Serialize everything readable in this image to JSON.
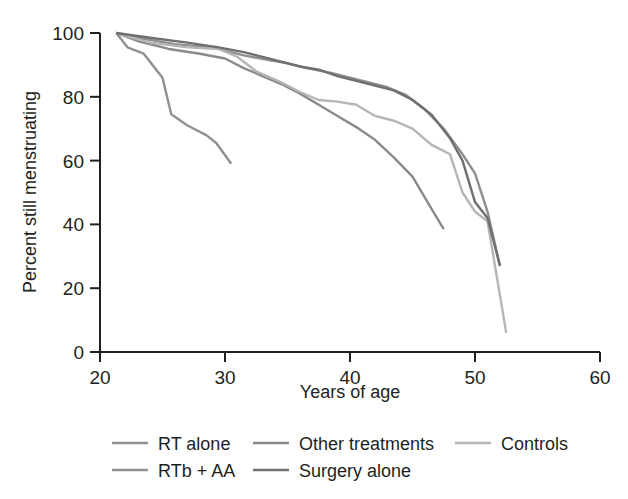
{
  "chart_data": {
    "type": "line",
    "title": "",
    "xlabel": "Years of age",
    "ylabel": "Percent still menstruating",
    "xlim": [
      20,
      60
    ],
    "ylim": [
      0,
      100
    ],
    "xticks": [
      20,
      30,
      40,
      50,
      60
    ],
    "yticks": [
      0,
      20,
      40,
      60,
      80,
      100
    ],
    "xtick_labels": [
      "20",
      "30",
      "40",
      "50",
      "60"
    ],
    "ytick_labels": [
      "0",
      "20",
      "40",
      "60",
      "80",
      "100"
    ],
    "grid": false,
    "legend_position": "bottom",
    "series": [
      {
        "name": "RT alone",
        "color": "#8e8e8e",
        "x": [
          21.3,
          23.0,
          26.0,
          29.0,
          31.5,
          33.5,
          35.0,
          36.5,
          38.5,
          40.0,
          41.5,
          43.0,
          44.5,
          46.0,
          47.5,
          49.0,
          50.0,
          51.0,
          52.0
        ],
        "y": [
          100,
          98.5,
          96.5,
          95.5,
          93.0,
          91.5,
          90.5,
          89.0,
          87.5,
          86.0,
          84.5,
          83.0,
          80.5,
          76.0,
          70.0,
          62.0,
          56.0,
          44.0,
          27.0
        ]
      },
      {
        "name": "Other treatments",
        "color": "#8a8a8a",
        "x": [
          21.3,
          23.0,
          25.5,
          28.0,
          30.0,
          31.5,
          33.0,
          34.5,
          36.0,
          37.5,
          39.0,
          40.5,
          42.0,
          43.5,
          45.0,
          46.5,
          47.5
        ],
        "y": [
          100,
          97.5,
          95.0,
          93.5,
          92.0,
          89.0,
          86.5,
          84.0,
          81.0,
          77.5,
          74.0,
          70.5,
          66.5,
          61.0,
          55.0,
          45.0,
          38.5
        ]
      },
      {
        "name": "Controls",
        "color": "#b5b5b5",
        "x": [
          21.3,
          24.0,
          27.0,
          29.5,
          31.0,
          32.5,
          34.5,
          36.0,
          37.5,
          39.0,
          40.5,
          42.0,
          43.5,
          45.0,
          46.5,
          48.0,
          49.0,
          50.0,
          51.0,
          52.5
        ],
        "y": [
          100,
          97.0,
          95.5,
          95.0,
          92.5,
          88.0,
          84.5,
          81.5,
          79.0,
          78.5,
          77.5,
          74.0,
          72.5,
          70.0,
          65.0,
          62.0,
          50.0,
          44.0,
          41.0,
          6.0
        ]
      },
      {
        "name": "RTb + AA",
        "color": "#909090",
        "x": [
          21.3,
          22.2,
          23.5,
          25.0,
          25.7,
          27.0,
          28.5,
          29.3,
          30.5
        ],
        "y": [
          100,
          95.5,
          93.5,
          86.0,
          74.5,
          71.0,
          68.0,
          65.5,
          59.0
        ]
      },
      {
        "name": "Surgery alone",
        "color": "#6f6f6f",
        "x": [
          21.3,
          24.0,
          27.0,
          29.5,
          31.5,
          33.0,
          34.5,
          36.0,
          37.5,
          39.0,
          40.5,
          42.0,
          43.5,
          45.0,
          46.5,
          48.0,
          49.0,
          50.0,
          51.0,
          52.0
        ],
        "y": [
          100,
          98.5,
          97.0,
          95.5,
          94.0,
          92.5,
          91.0,
          89.5,
          88.5,
          86.5,
          85.0,
          83.5,
          82.0,
          79.0,
          74.5,
          67.0,
          60.0,
          47.0,
          42.0,
          27.0
        ]
      }
    ],
    "legend_rows": [
      [
        {
          "label": "RT alone",
          "color": "#8e8e8e"
        },
        {
          "label": "Other treatments",
          "color": "#8a8a8a"
        },
        {
          "label": "Controls",
          "color": "#b5b5b5"
        }
      ],
      [
        {
          "label": "RTb + AA",
          "color": "#909090"
        },
        {
          "label": "Surgery alone",
          "color": "#6f6f6f"
        }
      ]
    ]
  }
}
